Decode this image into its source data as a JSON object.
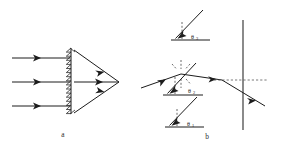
{
  "figure": {
    "panels": [
      {
        "id": "a",
        "caption": "a",
        "caption_x": 63,
        "caption_y": 137,
        "description": "Three parallel horizontal rays incident on a vertical blazed (sawtooth) grating, converging to a focal point on the right",
        "incident_rays": [
          {
            "x1": 12,
            "y1": 58,
            "x2": 70,
            "y2": 58,
            "arrow_at": 0.62
          },
          {
            "x1": 12,
            "y1": 82,
            "x2": 70,
            "y2": 82,
            "arrow_at": 0.62
          },
          {
            "x1": 12,
            "y1": 106,
            "x2": 70,
            "y2": 106,
            "arrow_at": 0.62
          }
        ],
        "grating": {
          "name": "blazed-grating",
          "x": 71,
          "y_top": 48,
          "y_bottom": 114,
          "teeth": 16,
          "tooth_depth": 5
        },
        "focus_point": {
          "x": 119,
          "y": 82
        },
        "converging_rays": [
          {
            "x1": 74,
            "y1": 50,
            "x2": 119,
            "y2": 82,
            "arrow_at": 0.62
          },
          {
            "x1": 74,
            "y1": 82,
            "x2": 119,
            "y2": 82,
            "arrow_at": 0.62
          },
          {
            "x1": 74,
            "y1": 113,
            "x2": 119,
            "y2": 82,
            "arrow_at": 0.62
          }
        ]
      },
      {
        "id": "b",
        "caption": "b",
        "caption_x": 207,
        "caption_y": 139,
        "description": "Incident ray refracted at an interface, with three angle markers theta-3, theta-2, theta-1 measured from dashed normals, and a screen at right",
        "angles": [
          {
            "name": "theta-3",
            "symbol": "θ",
            "subscript": "3",
            "label_x": 198,
            "label_y": 37,
            "baseline": {
              "x1": 171,
              "y1": 40,
              "x2": 210,
              "y2": 40
            },
            "ray": {
              "x1": 203,
              "y1": 10,
              "x2": 174,
              "y2": 39
            },
            "normal": {
              "x1": 182,
              "y1": 22,
              "x2": 182,
              "y2": 40
            }
          },
          {
            "name": "theta-2",
            "symbol": "θ",
            "subscript": "2",
            "label_x": 195,
            "label_y": 91,
            "baseline": {
              "x1": 163,
              "y1": 95,
              "x2": 203,
              "y2": 95
            },
            "ray": {
              "x1": 196,
              "y1": 63,
              "x2": 166,
              "y2": 94
            },
            "normal": {
              "x1": 175,
              "y1": 77,
              "x2": 175,
              "y2": 95
            }
          },
          {
            "name": "theta-1",
            "symbol": "θ",
            "subscript": "1",
            "label_x": 194,
            "label_y": 124,
            "baseline": {
              "x1": 165,
              "y1": 127,
              "x2": 204,
              "y2": 127
            },
            "ray": {
              "x1": 197,
              "y1": 97,
              "x2": 168,
              "y2": 126
            },
            "normal": {
              "x1": 177,
              "y1": 109,
              "x2": 177,
              "y2": 127
            }
          }
        ],
        "interface_point": {
          "x": 181,
          "y": 74
        },
        "incident_ray": {
          "x1": 141,
          "y1": 88,
          "x2": 181,
          "y2": 74,
          "arrow_at": 0.55
        },
        "refracted_ray": {
          "x1": 181,
          "y1": 74,
          "x2": 222,
          "y2": 80,
          "arrow_at": 0.78
        },
        "normal_marks": [
          {
            "x1": 181,
            "y1": 60,
            "x2": 181,
            "y2": 70
          },
          {
            "x1": 181,
            "y1": 78,
            "x2": 181,
            "y2": 88
          },
          {
            "x1": 172,
            "y1": 65,
            "x2": 177,
            "y2": 70
          },
          {
            "x1": 190,
            "y1": 65,
            "x2": 185,
            "y2": 70
          },
          {
            "x1": 186,
            "y1": 79,
            "x2": 191,
            "y2": 84
          }
        ],
        "screen": {
          "name": "screen-line",
          "x": 243,
          "y_top": 20,
          "y_bottom": 130
        },
        "axis_dashed": {
          "x1": 214,
          "y1": 80,
          "x2": 268,
          "y2": 80
        },
        "exit_ray": {
          "x1": 222,
          "y1": 80,
          "x2": 265,
          "y2": 106,
          "arrow_at": 0.72
        }
      }
    ]
  },
  "colors": {
    "line": "#1c1c1c",
    "dashed": "#555555",
    "text": "#1c1c1c",
    "background": "#ffffff"
  }
}
